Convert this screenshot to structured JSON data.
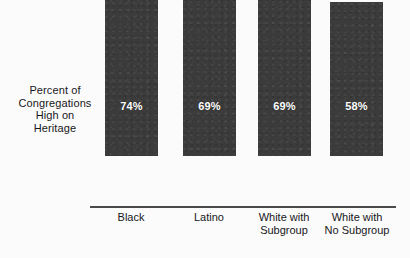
{
  "chart_data": {
    "type": "bar",
    "title": "",
    "subtitle": "",
    "xlabel": "",
    "ylabel": "Percent of Congregations High on Heritage",
    "ylabel_lines": [
      "Percent of",
      "Congregations",
      "High on",
      "Heritage"
    ],
    "categories": [
      "Black",
      "Latino",
      "White with Subgroup",
      "White with No Subgroup"
    ],
    "category_lines": [
      [
        "Black"
      ],
      [
        "Latino"
      ],
      [
        "White with",
        "Subgroup"
      ],
      [
        "White with",
        "No Subgroup"
      ]
    ],
    "values": [
      74,
      69,
      69,
      58
    ],
    "value_labels": [
      "74%",
      "69%",
      "69%",
      "58%"
    ],
    "ylim": [
      0,
      78
    ],
    "grid": false,
    "legend": false,
    "legend_position": "none",
    "units": "percent",
    "bar_color": "#3b3b3b",
    "value_label_color": "#ffffff",
    "axis_color": "#4a4a4a",
    "background_color": "#fbfbfb",
    "text_color": "#17171a"
  }
}
